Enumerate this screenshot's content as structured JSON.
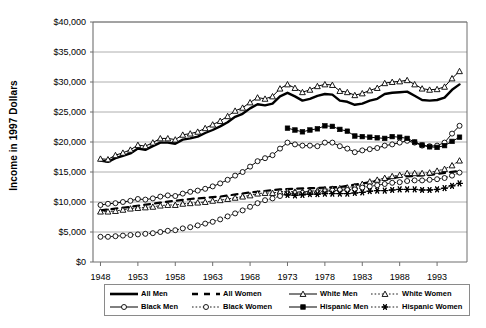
{
  "chart_data": {
    "type": "line",
    "title": "",
    "xlabel": "",
    "ylabel": "Income in 1997 Dollars",
    "xlim": [
      1947,
      1997
    ],
    "ylim": [
      0,
      40000
    ],
    "grid": true,
    "legend_position": "bottom",
    "y_ticks": [
      "$0",
      "$5,000",
      "$10,000",
      "$15,000",
      "$20,000",
      "$25,000",
      "$30,000",
      "$35,000",
      "$40,000"
    ],
    "y_tick_values": [
      0,
      5000,
      10000,
      15000,
      20000,
      25000,
      30000,
      35000,
      40000
    ],
    "x_ticks": [
      "1948",
      "1953",
      "1958",
      "1963",
      "1968",
      "1973",
      "1978",
      "1983",
      "1988",
      "1993"
    ],
    "x_tick_values": [
      1948,
      1953,
      1958,
      1963,
      1968,
      1973,
      1978,
      1983,
      1988,
      1993
    ],
    "series": [
      {
        "name": "All Men",
        "style": "thick-solid",
        "marker": "none",
        "color": "#000000",
        "x": [
          1948,
          1949,
          1950,
          1951,
          1952,
          1953,
          1954,
          1955,
          1956,
          1957,
          1958,
          1959,
          1960,
          1961,
          1962,
          1963,
          1964,
          1965,
          1966,
          1967,
          1968,
          1969,
          1970,
          1971,
          1972,
          1973,
          1974,
          1975,
          1976,
          1977,
          1978,
          1979,
          1980,
          1981,
          1982,
          1983,
          1984,
          1985,
          1986,
          1987,
          1988,
          1989,
          1990,
          1991,
          1992,
          1993,
          1994,
          1995,
          1996
        ],
        "values": [
          16900,
          16700,
          17300,
          17700,
          18100,
          18900,
          18700,
          19300,
          19900,
          19900,
          19700,
          20400,
          20600,
          20900,
          21500,
          22000,
          22600,
          23300,
          24200,
          24700,
          25600,
          26300,
          26100,
          26400,
          27600,
          28200,
          27600,
          26900,
          27200,
          27700,
          28000,
          27900,
          26900,
          26700,
          26200,
          26400,
          26900,
          27200,
          28000,
          28200,
          28300,
          28400,
          27700,
          27000,
          26900,
          27000,
          27400,
          28700,
          29600
        ]
      },
      {
        "name": "All Women",
        "style": "dashed",
        "marker": "none",
        "color": "#000000",
        "x": [
          1948,
          1952,
          1956,
          1960,
          1964,
          1968,
          1972,
          1976,
          1980,
          1984,
          1988,
          1992,
          1996
        ],
        "values": [
          8600,
          9200,
          9900,
          10500,
          10900,
          11600,
          12100,
          12300,
          12500,
          13300,
          14200,
          14500,
          15200
        ]
      },
      {
        "name": "White Men",
        "style": "solid",
        "marker": "triangle-open",
        "color": "#000000",
        "x": [
          1948,
          1949,
          1950,
          1951,
          1952,
          1953,
          1954,
          1955,
          1956,
          1957,
          1958,
          1959,
          1960,
          1961,
          1962,
          1963,
          1964,
          1965,
          1966,
          1967,
          1968,
          1969,
          1970,
          1971,
          1972,
          1973,
          1974,
          1975,
          1976,
          1977,
          1978,
          1979,
          1980,
          1981,
          1982,
          1983,
          1984,
          1985,
          1986,
          1987,
          1988,
          1989,
          1990,
          1991,
          1992,
          1993,
          1994,
          1995,
          1996
        ],
        "values": [
          17200,
          17100,
          17800,
          18200,
          18700,
          19500,
          19300,
          19900,
          20600,
          20600,
          20400,
          21200,
          21400,
          21700,
          22300,
          22900,
          23500,
          24300,
          25200,
          25700,
          26600,
          27400,
          27200,
          27600,
          28900,
          29600,
          29000,
          28300,
          28700,
          29300,
          29600,
          29500,
          28500,
          28300,
          27800,
          28100,
          28600,
          29000,
          29800,
          30000,
          30100,
          30300,
          29600,
          28900,
          28700,
          28800,
          29200,
          30600,
          31800
        ]
      },
      {
        "name": "White Women",
        "style": "dotted",
        "marker": "triangle-open",
        "color": "#000000",
        "x": [
          1948,
          1949,
          1950,
          1951,
          1952,
          1953,
          1954,
          1955,
          1956,
          1957,
          1958,
          1959,
          1960,
          1961,
          1962,
          1963,
          1964,
          1965,
          1966,
          1967,
          1968,
          1969,
          1970,
          1971,
          1972,
          1973,
          1974,
          1975,
          1976,
          1977,
          1978,
          1979,
          1980,
          1981,
          1982,
          1983,
          1984,
          1985,
          1986,
          1987,
          1988,
          1989,
          1990,
          1991,
          1992,
          1993,
          1994,
          1995,
          1996
        ],
        "values": [
          8400,
          8400,
          8500,
          8700,
          8900,
          9000,
          9100,
          9200,
          9400,
          9500,
          9500,
          9700,
          9800,
          9900,
          10000,
          10200,
          10300,
          10500,
          10700,
          10900,
          11100,
          11400,
          11500,
          11500,
          11700,
          11800,
          11700,
          11700,
          11800,
          11900,
          12100,
          12200,
          12300,
          12400,
          12600,
          13000,
          13400,
          13700,
          14000,
          14300,
          14500,
          14800,
          14800,
          14800,
          14900,
          15200,
          15500,
          16100,
          16900
        ]
      },
      {
        "name": "Black Men",
        "style": "solid",
        "marker": "circle-open",
        "color": "#000000",
        "x": [
          1948,
          1949,
          1950,
          1951,
          1952,
          1953,
          1954,
          1955,
          1956,
          1957,
          1958,
          1959,
          1960,
          1961,
          1962,
          1963,
          1964,
          1965,
          1966,
          1967,
          1968,
          1969,
          1970,
          1971,
          1972,
          1973,
          1974,
          1975,
          1976,
          1977,
          1978,
          1979,
          1980,
          1981,
          1982,
          1983,
          1984,
          1985,
          1986,
          1987,
          1988,
          1989,
          1990,
          1991,
          1992,
          1993,
          1994,
          1995,
          1996
        ],
        "values": [
          9500,
          9700,
          9800,
          10000,
          10200,
          10500,
          10400,
          10600,
          10900,
          11100,
          11000,
          11400,
          11700,
          11900,
          12200,
          12600,
          13100,
          13700,
          14400,
          15000,
          15900,
          16800,
          17300,
          17800,
          18900,
          19900,
          19600,
          19400,
          19400,
          19300,
          19900,
          19900,
          19300,
          18900,
          18300,
          18600,
          18800,
          19000,
          19400,
          19600,
          19900,
          20200,
          19900,
          19400,
          19300,
          19400,
          19900,
          21400,
          22700
        ]
      },
      {
        "name": "Black Women",
        "style": "dotted",
        "marker": "circle-open",
        "color": "#000000",
        "x": [
          1948,
          1949,
          1950,
          1951,
          1952,
          1953,
          1954,
          1955,
          1956,
          1957,
          1958,
          1959,
          1960,
          1961,
          1962,
          1963,
          1964,
          1965,
          1966,
          1967,
          1968,
          1969,
          1970,
          1971,
          1972,
          1973,
          1974,
          1975,
          1976,
          1977,
          1978,
          1979,
          1980,
          1981,
          1982,
          1983,
          1984,
          1985,
          1986,
          1987,
          1988,
          1989,
          1990,
          1991,
          1992,
          1993,
          1994,
          1995,
          1996
        ],
        "values": [
          4200,
          4200,
          4300,
          4400,
          4500,
          4600,
          4700,
          4800,
          5000,
          5200,
          5300,
          5600,
          5800,
          6100,
          6400,
          6700,
          7100,
          7600,
          8100,
          8600,
          9200,
          9800,
          10300,
          10600,
          11000,
          11400,
          11500,
          11500,
          11600,
          11600,
          11800,
          11900,
          12000,
          12000,
          12100,
          12400,
          12600,
          12800,
          13000,
          13200,
          13300,
          13500,
          13600,
          13600,
          13700,
          13800,
          14000,
          14400,
          14900
        ]
      },
      {
        "name": "Hispanic Men",
        "style": "solid",
        "marker": "square-filled",
        "color": "#000000",
        "x": [
          1973,
          1974,
          1975,
          1976,
          1977,
          1978,
          1979,
          1980,
          1981,
          1982,
          1983,
          1984,
          1985,
          1986,
          1987,
          1988,
          1989,
          1990,
          1991,
          1992,
          1993,
          1994,
          1995,
          1996
        ],
        "values": [
          22300,
          22000,
          21700,
          22000,
          22200,
          22700,
          22600,
          22100,
          21800,
          21000,
          20900,
          20800,
          20700,
          20600,
          20900,
          20800,
          20600,
          20000,
          19500,
          19200,
          19100,
          19400,
          20100,
          20800
        ]
      },
      {
        "name": "Hispanic Women",
        "style": "dotted",
        "marker": "star-filled",
        "color": "#000000",
        "x": [
          1973,
          1974,
          1975,
          1976,
          1977,
          1978,
          1979,
          1980,
          1981,
          1982,
          1983,
          1984,
          1985,
          1986,
          1987,
          1988,
          1989,
          1990,
          1991,
          1992,
          1993,
          1994,
          1995,
          1996
        ],
        "values": [
          11200,
          11100,
          11200,
          11300,
          11300,
          11400,
          11400,
          11400,
          11400,
          11500,
          11600,
          11800,
          11900,
          11900,
          12000,
          12100,
          12100,
          12100,
          12000,
          12000,
          12100,
          12300,
          12700,
          13100
        ]
      }
    ],
    "legend": [
      {
        "label": "All Men",
        "glyph": "thick-solid-line"
      },
      {
        "label": "All Women",
        "glyph": "dashed-line"
      },
      {
        "label": "White Men",
        "glyph": "solid-line-triangle-open-marker"
      },
      {
        "label": "White Women",
        "glyph": "dotted-line-triangle-open-marker"
      },
      {
        "label": "Black Men",
        "glyph": "solid-line-circle-open-marker"
      },
      {
        "label": "Black Women",
        "glyph": "dotted-line-circle-open-marker"
      },
      {
        "label": "Hispanic Men",
        "glyph": "solid-line-square-filled-marker"
      },
      {
        "label": "Hispanic Women",
        "glyph": "dotted-line-star-filled-marker"
      }
    ],
    "colors": {
      "line": "#000000",
      "grid": "#9a9a9a",
      "axis": "#6f6f6f",
      "background": "#ffffff"
    }
  }
}
